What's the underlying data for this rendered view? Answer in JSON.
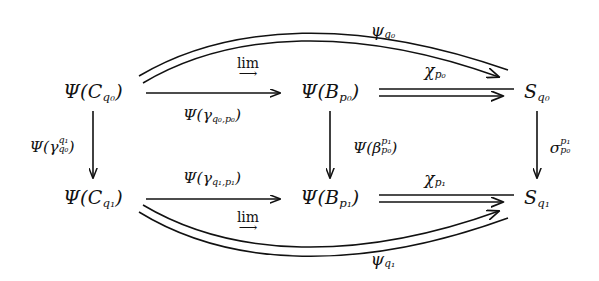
{
  "diagram": {
    "type": "commutative-diagram",
    "background_color": "#ffffff",
    "ink_color": "#111111",
    "nodes": [
      {
        "id": "C_q0",
        "label": "Ψ(C",
        "sub": "q₀",
        "tail": ")",
        "plain": "Ψ(C_{q0})",
        "x": 93,
        "y": 92
      },
      {
        "id": "B_p0",
        "label": "Ψ(B",
        "sub": "p₀",
        "tail": ")",
        "plain": "Ψ(B_{p0})",
        "x": 330,
        "y": 92
      },
      {
        "id": "S_q0",
        "label": "S",
        "sub": "q₀",
        "tail": "",
        "plain": "S_{q0}",
        "x": 537,
        "y": 92
      },
      {
        "id": "C_q1",
        "label": "Ψ(C",
        "sub": "q₁",
        "tail": ")",
        "plain": "Ψ(C_{q1})",
        "x": 93,
        "y": 198
      },
      {
        "id": "B_p1",
        "label": "Ψ(B",
        "sub": "p₁",
        "tail": ")",
        "plain": "Ψ(B_{p1})",
        "x": 330,
        "y": 198
      },
      {
        "id": "S_q1",
        "label": "S",
        "sub": "q₁",
        "tail": "",
        "plain": "S_{q1}",
        "x": 537,
        "y": 198
      }
    ],
    "arrow_labels": {
      "top_curve": {
        "base": "ψ",
        "sub": "q₀",
        "plain": "ψ_{q0}",
        "x": 383,
        "y": 30
      },
      "top_horiz_below": {
        "base": "Ψ(γ",
        "sub": "q₀,p₀",
        "tail": ")",
        "plain": "Ψ(γ_{q0,p0})",
        "x": 212,
        "y": 115
      },
      "top_lim": {
        "word": "lim",
        "arrow": "⟶",
        "plain": "lim →",
        "x": 248,
        "y": 68
      },
      "chi_p0": {
        "base": "χ",
        "sub": "p₀",
        "plain": "χ_{p0}",
        "x": 435,
        "y": 70
      },
      "left_vert": {
        "base": "Ψ(γ",
        "sup": "q₁",
        "sub": "q₀",
        "tail": ")",
        "plain": "Ψ(γ^{q1}_{q0})",
        "x": 52,
        "y": 145
      },
      "mid_vert": {
        "base": "Ψ(β",
        "sup": "p₁",
        "sub": "p₀",
        "tail": ")",
        "plain": "Ψ(β^{p1}_{p0})",
        "x": 375,
        "y": 146
      },
      "right_vert": {
        "base": "σ",
        "sup": "p₁",
        "sub": "p₀",
        "plain": "σ^{p1}_{p0}",
        "x": 560,
        "y": 146
      },
      "bot_horiz_above": {
        "base": "Ψ(γ",
        "sub": "q₁,p₁",
        "tail": ")",
        "plain": "Ψ(γ_{q1,p1})",
        "x": 212,
        "y": 178
      },
      "bot_lim": {
        "word": "lim",
        "arrow": "⟶",
        "plain": "lim →",
        "x": 248,
        "y": 222
      },
      "chi_p1": {
        "base": "χ",
        "sub": "p₁",
        "plain": "χ_{p1}",
        "x": 435,
        "y": 178
      },
      "bottom_curve": {
        "base": "ψ",
        "sub": "q₁",
        "plain": "ψ_{q1}",
        "x": 383,
        "y": 259
      }
    }
  }
}
